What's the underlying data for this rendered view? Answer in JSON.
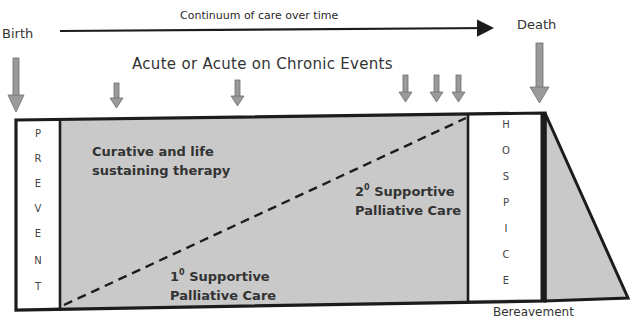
{
  "header": {
    "title": "Continuum of care over time",
    "start_label": "Birth",
    "end_label": "Death"
  },
  "events_label": "Acute or Acute on Chronic Events",
  "arrows": {
    "birth_arrow": "down-arrow",
    "death_arrow": "down-arrow",
    "event_arrows": [
      "down-arrow",
      "down-arrow",
      "down-arrow",
      "down-arrow",
      "down-arrow"
    ]
  },
  "columns": {
    "prevent": {
      "letters": [
        "P",
        "R",
        "E",
        "V",
        "E",
        "N",
        "T"
      ]
    },
    "hospice": {
      "letters": [
        "H",
        "O",
        "S",
        "P",
        "I",
        "C",
        "E"
      ]
    }
  },
  "regions": {
    "curative_line1": "Curative and life",
    "curative_line2": "sustaining therapy",
    "primary_prefix": "1",
    "primary_sup": "0",
    "primary_line1": " Supportive",
    "primary_line2": "Palliative Care",
    "secondary_prefix": "2",
    "secondary_sup": "0",
    "secondary_line1": " Supportive",
    "secondary_line2": "Palliative Care"
  },
  "footer": {
    "bereavement": "Bereavement"
  },
  "colors": {
    "fill": "#c9c9c9",
    "stroke": "#1c1c1c",
    "arrow_fill": "#9a9a9a",
    "arrow_stroke": "#6e6e6e"
  }
}
